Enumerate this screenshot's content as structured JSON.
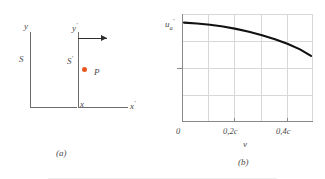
{
  "figure": {
    "panel_a": {
      "caption": "(a)",
      "frame_s_label": "S",
      "frame_s_prime_label": "S",
      "frame_s_prime_mark": "′",
      "axis_y_label": "y",
      "axis_x_label": "x",
      "axis_y_prime_label": "y",
      "axis_y_prime_mark": "′",
      "axis_x_prime_label": "x",
      "axis_x_prime_mark": "′",
      "point_label": "P",
      "point_color": "#e8561f",
      "velocity_arrow_name": "rightward-velocity-arrow"
    },
    "panel_b": {
      "caption": "(b)",
      "xlabel": "v",
      "ylabel_base": "u",
      "ylabel_sub": "a",
      "ylabel_prime": "′",
      "curve_color": "#111111",
      "grid_color": "#d8d8d8",
      "axis_color": "#8a8a8a"
    }
  },
  "chart_data": {
    "type": "line",
    "title": "",
    "xlabel": "v",
    "ylabel": "u'a",
    "x_tick_labels": [
      "0",
      "0,2c",
      "0,4c"
    ],
    "x_tick_values": [
      0,
      0.2,
      0.4
    ],
    "xlim": [
      0,
      0.5
    ],
    "ylim": [
      0,
      1.0
    ],
    "grid": true,
    "legend": false,
    "y_marked_tick": 0.4,
    "series": [
      {
        "name": "u'a vs v",
        "x": [
          0.0,
          0.05,
          0.1,
          0.15,
          0.2,
          0.25,
          0.3,
          0.35,
          0.4,
          0.45,
          0.5
        ],
        "y": [
          0.92,
          0.912,
          0.9,
          0.884,
          0.862,
          0.836,
          0.804,
          0.766,
          0.722,
          0.672,
          0.612
        ]
      }
    ]
  }
}
